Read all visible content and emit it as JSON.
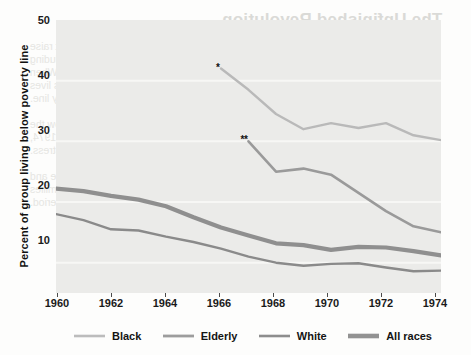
{
  "chart_data": {
    "type": "line",
    "title": "",
    "xlabel": "",
    "ylabel": "Percent of group living below poverty line",
    "xlim": [
      1960,
      1974
    ],
    "ylim": [
      5,
      50
    ],
    "grid": true,
    "legend_position": "bottom",
    "x_ticks": [
      "1960",
      "1962",
      "1964",
      "1966",
      "1968",
      "1970",
      "1972",
      "1974"
    ],
    "y_ticks": [
      "10",
      "20",
      "30",
      "40",
      "50"
    ],
    "annotations": [
      {
        "text": "*",
        "x": 1966,
        "y": 42
      },
      {
        "text": "**",
        "x": 1967,
        "y": 30
      }
    ],
    "series": [
      {
        "name": "Black",
        "color": "#b9b9b9",
        "width": 2.4,
        "x": [
          1966,
          1967,
          1968,
          1969,
          1970,
          1971,
          1972,
          1973,
          1974
        ],
        "values": [
          42,
          38.5,
          34.5,
          32,
          33,
          32.2,
          33,
          31,
          30.2
        ]
      },
      {
        "name": "Elderly",
        "color": "#9a9a9a",
        "width": 2.6,
        "x": [
          1967,
          1968,
          1969,
          1970,
          1971,
          1972,
          1973,
          1974
        ],
        "values": [
          30,
          25,
          25.5,
          24.5,
          21.5,
          18.5,
          16,
          15
        ]
      },
      {
        "name": "White",
        "color": "#8a8a8a",
        "width": 2.4,
        "x": [
          1960,
          1961,
          1962,
          1963,
          1964,
          1965,
          1966,
          1967,
          1968,
          1969,
          1970,
          1971,
          1972,
          1973,
          1974
        ],
        "values": [
          18,
          17,
          15.5,
          15.3,
          14.3,
          13.4,
          12.3,
          11,
          10,
          9.5,
          9.8,
          9.9,
          9.2,
          8.6,
          8.7
        ]
      },
      {
        "name": "All races",
        "color": "#8f8f8f",
        "width": 4.2,
        "x": [
          1960,
          1961,
          1962,
          1963,
          1964,
          1965,
          1966,
          1967,
          1968,
          1969,
          1970,
          1971,
          1972,
          1973,
          1974
        ],
        "values": [
          22.2,
          21.8,
          21,
          20.4,
          19.3,
          17.5,
          15.8,
          14.5,
          13.2,
          12.9,
          12.1,
          12.6,
          12.5,
          11.9,
          11.2
        ]
      }
    ]
  },
  "axis": {
    "y_title": "Percent of group living below poverty line",
    "y_labels": [
      "50",
      "40",
      "30",
      "20",
      "10"
    ],
    "x_labels": [
      "1960",
      "1962",
      "1964",
      "1966",
      "1968",
      "1970",
      "1972",
      "1974"
    ]
  },
  "legend": {
    "items": [
      {
        "label": "Black"
      },
      {
        "label": "Elderly"
      },
      {
        "label": "White"
      },
      {
        "label": "All races"
      }
    ]
  },
  "annotations": {
    "single_star": "*",
    "double_star": "**"
  },
  "bleed_through": {
    "heading": "The Unfinished Revolution",
    "lines": [
      "A number of the poor receive benefits that do not raise",
      "their income but improve their standard of living, including",
      "medical care, subsidized housing, and other services. When",
      "these benefits are counted, this group of Americans lives",
      "somewhat above the official poverty line.",
      "",
      "The proportion of families with incomes below the",
      "poverty line declined sharply between 1960 and 1974,",
      "yet millions of citizens remained in deep distress.",
      "",
      "Poverty rates differ substantially by race, age and",
      "family structure. The elderly and black families",
      "experienced the steepest declines during the period."
    ]
  }
}
